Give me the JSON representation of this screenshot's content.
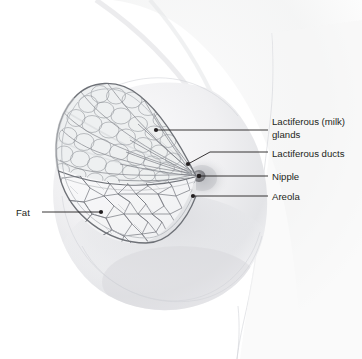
{
  "figure": {
    "style": "pencil sketch / medical illustration",
    "background_color": "#ffffff",
    "ink_color": "#231f20",
    "line_color": "#8c8f94",
    "flesh_shadow_color": "#e3e4e7"
  },
  "labels": [
    {
      "id": "glands",
      "lines": [
        "Lactiferous (milk)",
        "glands"
      ],
      "text_x": 272,
      "line1_y": 125,
      "line2_y": 138,
      "leader_x_start": 268,
      "leader_y": 130,
      "target_x": 156,
      "target_y": 130
    },
    {
      "id": "ducts",
      "lines": [
        "Lactiferous ducts"
      ],
      "text_x": 272,
      "line1_y": 157,
      "leader_x_start": 268,
      "leader_y": 152,
      "target_x": 188,
      "target_y": 164
    },
    {
      "id": "nipple",
      "lines": [
        "Nipple"
      ],
      "text_x": 272,
      "line1_y": 180,
      "leader_x_start": 268,
      "leader_y": 176,
      "target_x": 199,
      "target_y": 176
    },
    {
      "id": "areola",
      "lines": [
        "Areola"
      ],
      "text_x": 272,
      "line1_y": 200,
      "leader_x_start": 268,
      "leader_y": 196,
      "target_x": 193,
      "target_y": 196
    },
    {
      "id": "fat",
      "lines": [
        "Fat"
      ],
      "text_x": 16,
      "line1_y": 216,
      "leader_x_start": 42,
      "leader_y": 212,
      "target_x": 101,
      "target_y": 212
    }
  ]
}
